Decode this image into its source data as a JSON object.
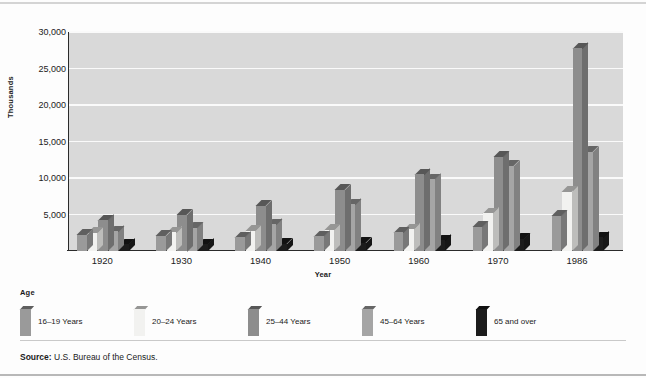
{
  "chart_data": {
    "type": "bar",
    "title": "",
    "xlabel": "Year",
    "ylabel": "Thousands",
    "categories": [
      "1920",
      "1930",
      "1940",
      "1950",
      "1960",
      "1970",
      "1986"
    ],
    "ylim": [
      0,
      30000
    ],
    "yticks": [
      5000,
      10000,
      15000,
      20000,
      25000,
      30000
    ],
    "ytick_labels": [
      "5,000",
      "10,000",
      "15,000",
      "20,000",
      "25,000",
      "30,000"
    ],
    "grid": true,
    "legend_position": "below-plot",
    "legend_title": "Age",
    "series": [
      {
        "name": "16–19 Years",
        "color": "#9a9a9a",
        "values": [
          2200,
          2100,
          1900,
          2000,
          2600,
          3300,
          4800
        ]
      },
      {
        "name": "20–24 Years",
        "color": "#f2f2f0",
        "values": [
          2500,
          2600,
          2800,
          2900,
          3000,
          5200,
          8100
        ]
      },
      {
        "name": "25–44 Years",
        "color": "#8d8d8d",
        "values": [
          4200,
          5000,
          6200,
          8400,
          10500,
          12900,
          27800
        ]
      },
      {
        "name": "45–64 Years",
        "color": "#a5a5a5",
        "values": [
          2700,
          3200,
          3700,
          6400,
          9800,
          11700,
          13600
        ]
      },
      {
        "name": "65 and over",
        "color": "#1c1c1c",
        "values": [
          900,
          950,
          1000,
          1150,
          1500,
          1700,
          1900
        ]
      }
    ]
  },
  "axis": {
    "y_label": "Thousands",
    "x_label": "Year",
    "y_ticks": [
      "30,000",
      "25,000",
      "20,000",
      "15,000",
      "10,000",
      "5,000"
    ],
    "x_ticks": [
      "1920",
      "1930",
      "1940",
      "1950",
      "1960",
      "1970",
      "1986"
    ]
  },
  "legend": {
    "title": "Age",
    "items": [
      {
        "label": "16–19 Years"
      },
      {
        "label": "20–24 Years"
      },
      {
        "label": "25–44 Years"
      },
      {
        "label": "45–64 Years"
      },
      {
        "label": "65 and over"
      }
    ]
  },
  "source": {
    "prefix": "Source:",
    "text": "U.S. Bureau of the Census."
  },
  "colors": {
    "plot_background": "#d9d9d9",
    "gridline": "#fafafa",
    "axis": "#2b2b2b",
    "series_16_19": "#9a9a9a",
    "series_20_24": "#f2f2f0",
    "series_25_44": "#8d8d8d",
    "series_45_64": "#a5a5a5",
    "series_65_over": "#1c1c1c"
  }
}
